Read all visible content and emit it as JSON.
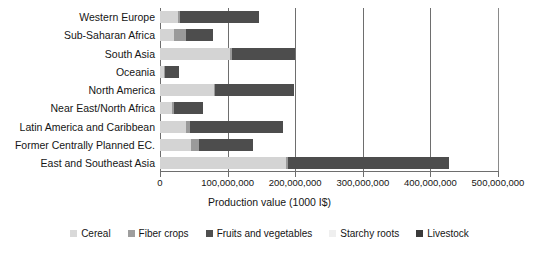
{
  "chart_data": {
    "type": "bar",
    "orientation": "horizontal",
    "stacked": true,
    "title": "",
    "xlabel": "Production value (1000 I$)",
    "ylabel": "",
    "xlim": [
      0,
      500000000
    ],
    "xticks": [
      0,
      100000000,
      200000000,
      300000000,
      400000000,
      500000000
    ],
    "xtick_labels": [
      "0",
      "100,000,000",
      "200,000,000",
      "300,000,000",
      "400,000,000",
      "500,000,000"
    ],
    "grid": true,
    "grid_axis": "x",
    "legend_position": "bottom",
    "categories": [
      "Western Europe",
      "Sub-Saharan Africa",
      "South Asia",
      "Oceania",
      "North America",
      "Near East/North Africa",
      "Latin America and Caribbean",
      "Former Centrally Planned EC.",
      "East and Southeast Asia"
    ],
    "series": [
      {
        "name": "Cereal",
        "color": "#d4d4d4",
        "values": [
          26000000,
          20000000,
          103000000,
          6000000,
          80000000,
          18000000,
          38000000,
          46000000,
          186000000
        ]
      },
      {
        "name": "Fiber crops",
        "color": "#9a9a9a",
        "values": [
          3000000,
          18000000,
          3000000,
          1000000,
          2000000,
          3000000,
          6000000,
          11000000,
          4000000
        ]
      },
      {
        "name": "Fruits and vegetables",
        "color": "#4d4d4d",
        "values": [
          118000000,
          40000000,
          93000000,
          21000000,
          116000000,
          42000000,
          138000000,
          80000000,
          238000000
        ]
      },
      {
        "name": "Starchy roots",
        "color": "#ececec",
        "values": [
          0,
          0,
          0,
          0,
          0,
          0,
          0,
          0,
          0
        ]
      },
      {
        "name": "Livestock",
        "color": "#3b3b3b",
        "values": [
          0,
          0,
          0,
          0,
          0,
          0,
          0,
          0,
          0
        ]
      }
    ],
    "totals": [
      147000000,
      78000000,
      199000000,
      28000000,
      198000000,
      63000000,
      182000000,
      137000000,
      428000000
    ]
  },
  "legend": {
    "items": [
      {
        "label": "Cereal",
        "color": "#d9d9d9"
      },
      {
        "label": "Fiber crops",
        "color": "#9e9e9e"
      },
      {
        "label": "Fruits and vegetables",
        "color": "#4f4f4f"
      },
      {
        "label": "Starchy roots",
        "color": "#efefef"
      },
      {
        "label": "Livestock",
        "color": "#3a3a3a"
      }
    ]
  },
  "axis": {
    "x_title": "Production value (1000 I$)"
  },
  "colors": {
    "axis": "#6e6e6e",
    "text": "#151515",
    "background": "#ffffff"
  }
}
